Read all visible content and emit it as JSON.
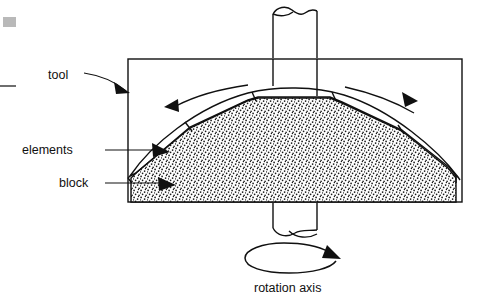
{
  "figure": {
    "labels": {
      "tool": "tool",
      "elements": "elements",
      "block": "block",
      "rotation_axis": "rotation axis"
    },
    "colors": {
      "line": "#101010",
      "background": "#ffffff",
      "stipple": "#1a1a1a",
      "artifact_gray": "#b9b9b9",
      "artifact_dark": "#6e6e6e"
    },
    "geometry": {
      "tool_rect": {
        "x": 128,
        "y": 59,
        "width": 334,
        "height": 143
      },
      "block_base_y": 202,
      "block_left_x": 128,
      "block_right_x": 462,
      "shaft_left_x": 272,
      "shaft_right_x": 318,
      "shaft_top_y": 4,
      "shaft_bottom_y": 236,
      "element_joint_count": 4
    },
    "annotations": {
      "arc_arrow_left": "counter-clockwise-flow-arrow",
      "arc_arrow_right": "clockwise-flow-arrow",
      "rotation_arrow": "circular-rotation-arrow"
    }
  }
}
